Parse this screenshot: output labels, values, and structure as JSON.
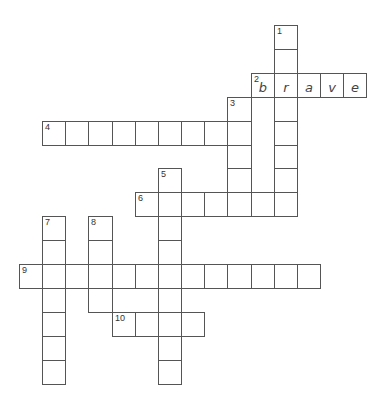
{
  "puzzle": {
    "type": "crossword",
    "cell_width": 23.15,
    "cell_height": 23.9,
    "origin_x": 19,
    "origin_y": 25,
    "words": [
      {
        "number": 1,
        "direction": "down",
        "row": 0,
        "col": 11,
        "length": 8,
        "letters": [
          "",
          "",
          "r",
          "",
          "",
          "",
          "",
          ""
        ]
      },
      {
        "number": 2,
        "direction": "across",
        "row": 2,
        "col": 10,
        "length": 5,
        "letters": [
          "b",
          "r",
          "a",
          "v",
          "e"
        ]
      },
      {
        "number": 3,
        "direction": "down",
        "row": 3,
        "col": 9,
        "length": 5,
        "letters": [
          "",
          "",
          "",
          "",
          ""
        ]
      },
      {
        "number": 4,
        "direction": "across",
        "row": 4,
        "col": 1,
        "length": 9,
        "letters": [
          "",
          "",
          "",
          "",
          "",
          "",
          "",
          "",
          ""
        ]
      },
      {
        "number": 5,
        "direction": "down",
        "row": 6,
        "col": 6,
        "length": 9,
        "letters": [
          "",
          "",
          "",
          "",
          "",
          "",
          "",
          "",
          ""
        ]
      },
      {
        "number": 6,
        "direction": "across",
        "row": 7,
        "col": 5,
        "length": 7,
        "letters": [
          "",
          "",
          "",
          "",
          "",
          "",
          ""
        ]
      },
      {
        "number": 7,
        "direction": "down",
        "row": 8,
        "col": 1,
        "length": 7,
        "letters": [
          "",
          "",
          "",
          "",
          "",
          "",
          ""
        ]
      },
      {
        "number": 8,
        "direction": "down",
        "row": 8,
        "col": 3,
        "length": 4,
        "letters": [
          "",
          "",
          "",
          ""
        ]
      },
      {
        "number": 9,
        "direction": "across",
        "row": 10,
        "col": 0,
        "length": 13,
        "letters": [
          "",
          "",
          "",
          "",
          "",
          "",
          "",
          "",
          "",
          "",
          "",
          "",
          ""
        ]
      },
      {
        "number": 10,
        "direction": "across",
        "row": 12,
        "col": 4,
        "length": 4,
        "letters": [
          "",
          "",
          "",
          ""
        ]
      }
    ]
  }
}
